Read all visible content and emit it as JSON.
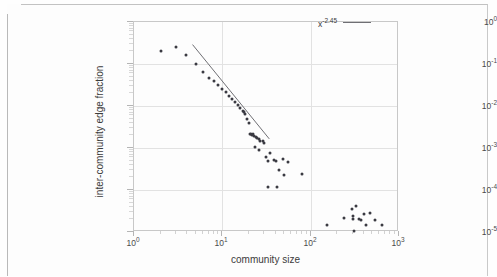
{
  "figure": {
    "background_color": "#fdfdfd",
    "axis_color": "#c8c8c8",
    "marker_color": "#3a3a42",
    "trend_color": "#6f6f74"
  },
  "legend": {
    "entry_base": "x",
    "entry_exponent": "-2.45",
    "line_sample_name": "power-law-line"
  },
  "axes": {
    "x": {
      "label": "community size",
      "ticks": [
        {
          "base": "10",
          "exp": "0"
        },
        {
          "base": "10",
          "exp": "1"
        },
        {
          "base": "10",
          "exp": "2"
        },
        {
          "base": "10",
          "exp": "3"
        }
      ]
    },
    "y": {
      "label": "inter-community edge fraction",
      "ticks": [
        {
          "base": "10",
          "exp": "0"
        },
        {
          "base": "10",
          "exp": "-1"
        },
        {
          "base": "10",
          "exp": "-2"
        },
        {
          "base": "10",
          "exp": "-3"
        },
        {
          "base": "10",
          "exp": "-4"
        },
        {
          "base": "10",
          "exp": "-5"
        }
      ]
    }
  },
  "chart_data": {
    "type": "scatter",
    "title": "",
    "xlabel": "community size",
    "ylabel": "inter-community edge fraction",
    "xscale": "log",
    "yscale": "log",
    "xlim": [
      1,
      1000
    ],
    "ylim": [
      1e-05,
      1
    ],
    "grid": true,
    "legend_position": "top-right",
    "series": [
      {
        "name": "inter-community edge fraction",
        "marker": "circle",
        "color": "#3a3a42",
        "points": [
          [
            2.0,
            0.205
          ],
          [
            3.0,
            0.255
          ],
          [
            3.9,
            0.168
          ],
          [
            5.0,
            0.099
          ],
          [
            6.1,
            0.064
          ],
          [
            7.0,
            0.047
          ],
          [
            8.0,
            0.04
          ],
          [
            9.0,
            0.0315
          ],
          [
            10.0,
            0.0255
          ],
          [
            11.0,
            0.0215
          ],
          [
            12.0,
            0.0175
          ],
          [
            13.0,
            0.0145
          ],
          [
            14.0,
            0.0122
          ],
          [
            15.0,
            0.0104
          ],
          [
            16.0,
            0.009
          ],
          [
            17.0,
            0.0076
          ],
          [
            17.6,
            0.0072
          ],
          [
            18.2,
            0.0063
          ],
          [
            19.0,
            0.005
          ],
          [
            20.0,
            0.004
          ],
          [
            20.6,
            0.0022
          ],
          [
            21.2,
            0.0021
          ],
          [
            21.8,
            0.002
          ],
          [
            22.4,
            0.0022
          ],
          [
            23.0,
            0.0019
          ],
          [
            24.0,
            0.0018
          ],
          [
            25.0,
            0.0017
          ],
          [
            26.0,
            0.0016
          ],
          [
            27.0,
            0.0015
          ],
          [
            28.5,
            0.00145
          ],
          [
            30.0,
            0.00135
          ],
          [
            23.5,
            0.00105
          ],
          [
            26.0,
            0.00092
          ],
          [
            31.0,
            0.00062
          ],
          [
            33.0,
            0.00048
          ],
          [
            35.0,
            0.00075
          ],
          [
            38.0,
            0.00052
          ],
          [
            41.0,
            0.00048
          ],
          [
            44.0,
            0.0003
          ],
          [
            48.0,
            0.00055
          ],
          [
            50.0,
            0.00023
          ],
          [
            56.0,
            0.00046
          ],
          [
            80.0,
            0.00024
          ],
          [
            33.0,
            0.000118
          ],
          [
            42.0,
            0.000115
          ],
          [
            155.0,
            1.45e-05
          ],
          [
            240.0,
            2.15e-05
          ],
          [
            290.0,
            3.45e-05
          ],
          [
            300.0,
            2.35e-05
          ],
          [
            305.0,
            2.05e-05
          ],
          [
            310.0,
            1.05e-05
          ],
          [
            330.0,
            4.15e-05
          ],
          [
            355.0,
            2e-05
          ],
          [
            370.0,
            1.9e-05
          ],
          [
            400.0,
            2.7e-05
          ],
          [
            420.0,
            1.45e-05
          ],
          [
            470.0,
            2.9e-05
          ],
          [
            530.0,
            1.95e-05
          ],
          [
            650.0,
            1.45e-05
          ]
        ]
      }
    ],
    "annotations": [
      {
        "name": "power-law-reference-line",
        "type": "line",
        "label": "x^-2.45",
        "exponent": -2.45,
        "x_start": 4.6,
        "y_start": 0.29,
        "x_end": 34.0,
        "y_end": 0.00165,
        "color": "#6f6f74"
      }
    ]
  }
}
